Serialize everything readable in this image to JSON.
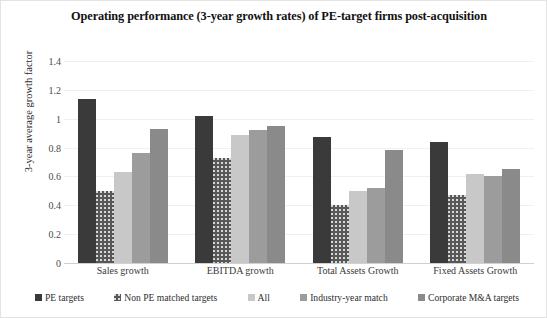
{
  "chart_data": {
    "type": "bar",
    "title": "Operating performance (3-year growth rates) of PE-target firms post-acquisition",
    "xlabel": "",
    "ylabel": "3-year average growth factor",
    "ylim": [
      0,
      1.4
    ],
    "yticks": [
      "0",
      "0.2",
      "0.4",
      "0.6",
      "0.8",
      "1",
      "1.2",
      "1.4"
    ],
    "grid": true,
    "legend_position": "bottom",
    "categories": [
      "Sales growth",
      "EBITDA growth",
      "Total Assets Growth",
      "Fixed Assets Growth"
    ],
    "series": [
      {
        "name": "PE targets",
        "color": "#3a3a3a",
        "values": [
          1.14,
          1.02,
          0.87,
          0.84
        ]
      },
      {
        "name": "Non PE matched targets",
        "color": "#585858",
        "values": [
          0.5,
          0.73,
          0.4,
          0.47
        ]
      },
      {
        "name": "All",
        "color": "#c8c8c8",
        "values": [
          0.63,
          0.89,
          0.5,
          0.62
        ]
      },
      {
        "name": "Industry-year match",
        "color": "#9c9c9c",
        "values": [
          0.76,
          0.92,
          0.52,
          0.6
        ]
      },
      {
        "name": "Corporate M&A targets",
        "color": "#8a8a8a",
        "values": [
          0.93,
          0.95,
          0.78,
          0.65
        ]
      }
    ]
  }
}
